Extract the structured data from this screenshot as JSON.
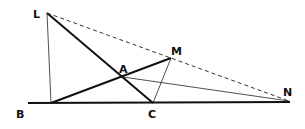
{
  "diagram": {
    "type": "geometry",
    "points": {
      "L": {
        "label": "L",
        "x": 47,
        "y": 13
      },
      "M": {
        "label": "M",
        "x": 171,
        "y": 58
      },
      "A": {
        "label": "A",
        "x": 123,
        "y": 77
      },
      "B": {
        "label": "B",
        "x": 22,
        "y": 103
      },
      "C": {
        "label": "C",
        "x": 153,
        "y": 103
      },
      "N": {
        "label": "N",
        "x": 289,
        "y": 101
      }
    },
    "segments": [
      {
        "from": "B-line-start",
        "to": "N",
        "style": "thick"
      },
      {
        "from": "L",
        "to": "C",
        "style": "thick"
      },
      {
        "from": "base-foot",
        "to": "M",
        "style": "thick"
      },
      {
        "from": "L",
        "to": "base-foot",
        "style": "thin"
      },
      {
        "from": "M",
        "to": "C",
        "style": "thin"
      },
      {
        "from": "A",
        "to": "N",
        "style": "thin"
      },
      {
        "from": "L",
        "to": "N",
        "style": "dashed"
      }
    ]
  }
}
